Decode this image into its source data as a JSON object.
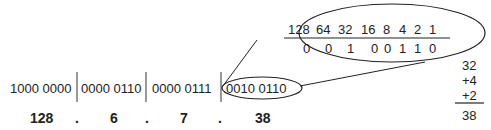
{
  "octets": [
    {
      "binary": "1000 0000",
      "decimal": "128"
    },
    {
      "binary": "0000 0110",
      "decimal": "6"
    },
    {
      "binary": "0000 0111",
      "decimal": "7"
    },
    {
      "binary": "0010 0110",
      "decimal": "38"
    }
  ],
  "dot": ".",
  "place_values": [
    "128",
    "64",
    "32",
    "16",
    "8",
    "4",
    "2",
    "1"
  ],
  "bits": [
    "0",
    "0",
    "1",
    "0",
    "0",
    "1",
    "1",
    "0"
  ],
  "sum": {
    "terms": [
      "32",
      "+4",
      "+2"
    ],
    "total": "38"
  }
}
